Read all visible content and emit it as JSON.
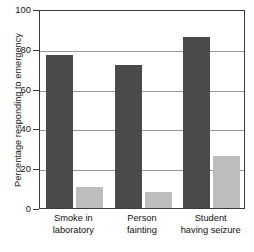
{
  "chart_data": {
    "type": "bar",
    "title": "",
    "xlabel": "",
    "ylabel": "Percentage responding to emergency",
    "ylim": [
      0,
      100
    ],
    "yticks": [
      0,
      20,
      40,
      60,
      80,
      100
    ],
    "ytick_labels": [
      "0",
      "20",
      "40",
      "60",
      "80",
      "100"
    ],
    "grid": true,
    "legend": "none",
    "categories": [
      "Smoke in laboratory",
      "Person fainting",
      "Student having seizure"
    ],
    "category_lines": [
      [
        "Smoke in",
        "laboratory"
      ],
      [
        "Person",
        "fainting"
      ],
      [
        "Student",
        "having seizure"
      ]
    ],
    "series": [
      {
        "name": "dark",
        "color": "#4a4a4a",
        "values": [
          77,
          72,
          86
        ]
      },
      {
        "name": "light",
        "color": "#bdbdbd",
        "values": [
          10.5,
          8,
          26
        ]
      }
    ]
  },
  "axis": {
    "frame_color": "#3a3a3a",
    "grid_color": "#9a9a9a"
  }
}
